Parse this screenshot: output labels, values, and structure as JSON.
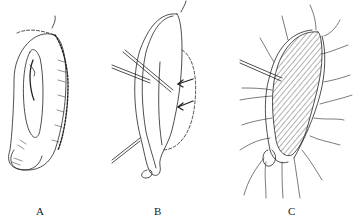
{
  "figure": {
    "panels": [
      {
        "id": "A",
        "label": "A",
        "description": "external ear"
      },
      {
        "id": "B",
        "label": "B",
        "description": "ear with instruments and arrows"
      },
      {
        "id": "C",
        "label": "C",
        "description": "hatched region with sutures"
      }
    ]
  }
}
